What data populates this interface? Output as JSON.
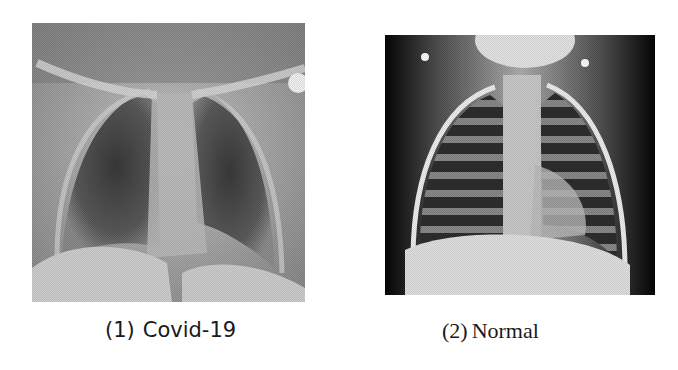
{
  "figure": {
    "panels": [
      {
        "id": 1,
        "number": "(1)",
        "label": "Covid-19",
        "image_description": "Chest X-ray (frontal view) with hazy lung opacities, grayscale",
        "tone": {
          "background": "#9a9a9a",
          "lung": "#4a4a4a",
          "bone": "#d8d8d8",
          "soft": "#b8b8b8"
        }
      },
      {
        "id": 2,
        "number": "(2)",
        "label": "Normal",
        "image_description": "Chest X-ray (frontal view) with clear lung fields, high contrast grayscale",
        "tone": {
          "background": "#0d0d0d",
          "lung": "#3c3c3c",
          "bone": "#f0f0f0",
          "soft": "#cfcfcf"
        }
      }
    ]
  }
}
